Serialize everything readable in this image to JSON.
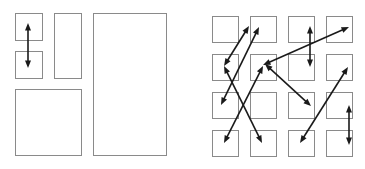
{
  "figure": {
    "background_color": "#ffffff",
    "box_stroke_color": "#8a8a8a",
    "arrow_color": "#1a1a1a",
    "width": 365,
    "height": 169
  },
  "panels": [
    {
      "id": "left",
      "name": "irregular-block-layout",
      "description": "Irregular rectangle packing with a single vertical double-headed arrow",
      "boxes": [
        {
          "name": "small-square-top",
          "x": 15,
          "y": 13,
          "w": 27,
          "h": 27
        },
        {
          "name": "small-square-bottom",
          "x": 15,
          "y": 51,
          "w": 27,
          "h": 27
        },
        {
          "name": "tall-narrow-rect",
          "x": 54,
          "y": 13,
          "w": 27,
          "h": 65
        },
        {
          "name": "large-square",
          "x": 15,
          "y": 89,
          "w": 66,
          "h": 66
        },
        {
          "name": "full-height-rect",
          "x": 93,
          "y": 13,
          "w": 73,
          "h": 142
        }
      ],
      "arrows": [
        {
          "name": "arrow-vertical-small-squares",
          "x1": 28,
          "y1": 23,
          "x2": 28,
          "y2": 68,
          "double": true
        }
      ]
    },
    {
      "id": "right",
      "name": "uniform-grid-layout",
      "description": "Four by four uniform grid of squares linked by eight double-headed arrows",
      "grid": {
        "rows": 4,
        "cols": 4,
        "origin_x": 29,
        "origin_y": 16,
        "cell_size": 26,
        "pitch_x": 38,
        "pitch_y": 38
      },
      "arrows": [
        {
          "name": "arrow-r2c1-to-r1c2",
          "x1": 41,
          "y1": 66,
          "x2": 66,
          "y2": 26,
          "double": true
        },
        {
          "name": "arrow-r3c1-to-r1c3",
          "x1": 38,
          "y1": 105,
          "x2": 76,
          "y2": 27,
          "double": true
        },
        {
          "name": "arrow-r4c1-to-r2c2",
          "x1": 41,
          "y1": 143,
          "x2": 80,
          "y2": 66,
          "double": true
        },
        {
          "name": "arrow-r4c2-to-r2c1",
          "x1": 79,
          "y1": 143,
          "x2": 41,
          "y2": 66,
          "double": true
        },
        {
          "name": "arrow-r1c4-to-r2c2",
          "x1": 166,
          "y1": 27,
          "x2": 80,
          "y2": 65,
          "double": true
        },
        {
          "name": "arrow-r1c3-to-r2c3",
          "x1": 127,
          "y1": 26,
          "x2": 127,
          "y2": 67,
          "double": true
        },
        {
          "name": "arrow-r2c4-to-r4c3",
          "x1": 165,
          "y1": 67,
          "x2": 117,
          "y2": 143,
          "double": true
        },
        {
          "name": "arrow-r3c4-to-r4c4",
          "x1": 166,
          "y1": 105,
          "x2": 166,
          "y2": 145,
          "double": true
        },
        {
          "name": "arrow-r2c2-to-r3c3",
          "x1": 82,
          "y1": 64,
          "x2": 128,
          "y2": 106,
          "double": true
        }
      ]
    }
  ]
}
